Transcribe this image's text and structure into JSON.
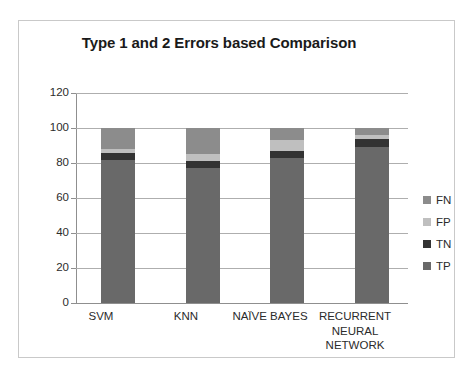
{
  "chart_data": {
    "type": "bar",
    "subtype": "stacked-column",
    "title": "Type 1 and 2 Errors based Comparison",
    "xlabel": "",
    "ylabel": "",
    "ylim": [
      0,
      120
    ],
    "yticks": [
      0,
      20,
      40,
      60,
      80,
      100,
      120
    ],
    "ytick_labels": [
      "0",
      "20",
      "40",
      "60",
      "80",
      "100",
      "120"
    ],
    "grid": true,
    "legend_position": "right",
    "categories": [
      "SVM",
      "KNN",
      "NAÏVE BAYES",
      "RECURRENT NEURAL NETWORK"
    ],
    "category_lines": [
      [
        "SVM"
      ],
      [
        "KNN"
      ],
      [
        "NAÏVE BAYES"
      ],
      [
        "RECURRENT",
        "NEURAL",
        "NETWORK"
      ]
    ],
    "stack_order_bottom_to_top": [
      "TP",
      "TN",
      "FP",
      "FN"
    ],
    "series": [
      {
        "name": "TP",
        "color": "#696969",
        "values": [
          82,
          77,
          83,
          89
        ]
      },
      {
        "name": "TN",
        "color": "#333333",
        "values": [
          4,
          4,
          4,
          5
        ]
      },
      {
        "name": "FP",
        "color": "#bfbfbf",
        "values": [
          2,
          4,
          6,
          2
        ]
      },
      {
        "name": "FN",
        "color": "#8c8c8c",
        "values": [
          12,
          15,
          7,
          4
        ]
      }
    ],
    "legend_entries": [
      {
        "label": "FN",
        "color": "#8c8c8c"
      },
      {
        "label": "FP",
        "color": "#bfbfbf"
      },
      {
        "label": "TN",
        "color": "#333333"
      },
      {
        "label": "TP",
        "color": "#696969"
      }
    ],
    "totals": [
      100,
      100,
      100,
      100
    ]
  },
  "colors": {
    "frame_border": "#c9c9c9",
    "gridline": "#aeaeae",
    "axis": "#8f8f8f",
    "text": "#2b2b2b",
    "title": "#1a1a1a"
  }
}
